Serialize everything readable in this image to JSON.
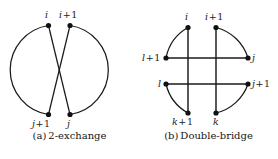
{
  "figure": {
    "panels": [
      {
        "id": "a",
        "caption_tag": "(a)",
        "caption_text": "2-exchange",
        "node_labels": [
          {
            "name": "i",
            "base": "i",
            "op": "",
            "num": ""
          },
          {
            "name": "i+1",
            "base": "i",
            "op": "+",
            "num": "1"
          },
          {
            "name": "j+1",
            "base": "j",
            "op": "+",
            "num": "1"
          },
          {
            "name": "j",
            "base": "j",
            "op": "",
            "num": ""
          }
        ]
      },
      {
        "id": "b",
        "caption_tag": "(b)",
        "caption_text": "Double-bridge",
        "node_labels": [
          {
            "name": "i",
            "base": "i",
            "op": "",
            "num": ""
          },
          {
            "name": "i+1",
            "base": "i",
            "op": "+",
            "num": "1"
          },
          {
            "name": "j",
            "base": "j",
            "op": "",
            "num": ""
          },
          {
            "name": "j+1",
            "base": "j",
            "op": "+",
            "num": "1"
          },
          {
            "name": "k",
            "base": "k",
            "op": "",
            "num": ""
          },
          {
            "name": "k+1",
            "base": "k",
            "op": "+",
            "num": "1"
          },
          {
            "name": "l",
            "base": "l",
            "op": "",
            "num": ""
          },
          {
            "name": "l+1",
            "base": "l",
            "op": "+",
            "num": "1"
          }
        ]
      }
    ],
    "colors": {
      "stroke": "#1a1a1a",
      "node_fill": "#111111",
      "background": "#ffffff",
      "text": "#1b1b1b"
    }
  }
}
